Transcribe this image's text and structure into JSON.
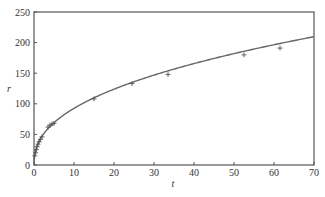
{
  "chart_data": {
    "type": "scatter",
    "title": "",
    "xlabel": "t",
    "ylabel": "r",
    "xlim": [
      0,
      70
    ],
    "ylim": [
      0,
      250
    ],
    "x_ticks": [
      0,
      10,
      20,
      30,
      40,
      50,
      60,
      70
    ],
    "y_ticks": [
      0,
      50,
      100,
      150,
      200,
      250
    ],
    "grid": false,
    "legend": null,
    "series": [
      {
        "name": "observed",
        "marker": "+",
        "points": [
          [
            0.2,
            15
          ],
          [
            0.4,
            20
          ],
          [
            0.6,
            25
          ],
          [
            0.8,
            30
          ],
          [
            1.0,
            34
          ],
          [
            1.3,
            38
          ],
          [
            1.6,
            42
          ],
          [
            2.0,
            46
          ],
          [
            3.5,
            62
          ],
          [
            4.0,
            65
          ],
          [
            4.5,
            67
          ],
          [
            5.0,
            68
          ],
          [
            15,
            108
          ],
          [
            24.5,
            133
          ],
          [
            33.5,
            148
          ],
          [
            52.5,
            180
          ],
          [
            61.5,
            191
          ]
        ]
      },
      {
        "name": "fitted curve",
        "style": "line",
        "model": "r = 35.2 * t^0.42",
        "a": 35.2,
        "b": 0.42
      }
    ]
  }
}
